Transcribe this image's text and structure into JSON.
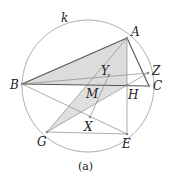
{
  "figure": {
    "caption": "(a)",
    "circle_label": "k",
    "points": {
      "A": {
        "label": "A",
        "x": 127,
        "y": 38
      },
      "B": {
        "label": "B",
        "x": 22,
        "y": 84
      },
      "C": {
        "label": "C",
        "x": 149,
        "y": 86
      },
      "Z": {
        "label": "Z",
        "x": 148,
        "y": 73
      },
      "H": {
        "label": "H",
        "x": 127,
        "y": 85
      },
      "E": {
        "label": "E",
        "x": 127,
        "y": 134
      },
      "G": {
        "label": "G",
        "x": 47,
        "y": 132
      },
      "X": {
        "label": "X",
        "x": 90,
        "y": 117
      },
      "Y": {
        "label": "Y",
        "x": 109,
        "y": 75
      },
      "M": {
        "label": "M",
        "x": 96,
        "y": 86
      }
    },
    "colors": {
      "line": "#555555",
      "thin_line": "#8a8a8a",
      "shade": "#dcdcdc",
      "circle": "#9a9a9a"
    }
  }
}
